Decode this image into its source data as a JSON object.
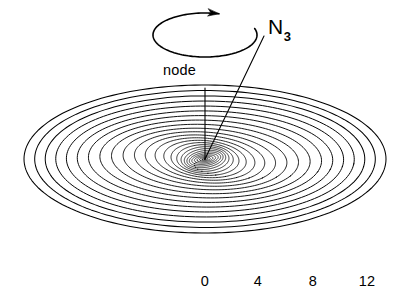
{
  "figure": {
    "type": "warped-disk-diagram",
    "background_color": "#ffffff",
    "line_color": "#000000"
  },
  "labels": {
    "node": "node",
    "angular_momentum_symbol": "N",
    "angular_momentum_subscript": "3"
  },
  "axis": {
    "ticks": [
      {
        "label": "0",
        "x": 205
      },
      {
        "label": "4",
        "x": 258
      },
      {
        "label": "8",
        "x": 313
      },
      {
        "label": "12",
        "x": 367
      }
    ],
    "tick_y": 274
  },
  "chart_data": {
    "type": "line",
    "title": "",
    "xlabel": "",
    "ylabel": "",
    "categories": [
      "0",
      "4",
      "8",
      "12"
    ],
    "values": [
      0,
      4,
      8,
      12
    ],
    "xlim": [
      0,
      13
    ],
    "grid": false,
    "legend": "none",
    "annotations": [
      "node",
      "N3"
    ],
    "geometry": {
      "center_x": 205,
      "center_y": 159,
      "outer_semi_major": 181,
      "outer_semi_minor": 74,
      "ring_count": 26,
      "spoke_count": 8,
      "twist_deg_total": 150,
      "tilt_scale_inner": 0.62
    },
    "rotation_arrow": {
      "center_x": 205,
      "center_y": 35,
      "rx": 52,
      "ry": 22,
      "direction": "clockwise-from-above"
    },
    "node_line": {
      "x1": 205,
      "y1": 88,
      "x2": 205,
      "y2": 159
    },
    "n3_vector": {
      "x1": 205,
      "y1": 159,
      "x2": 264,
      "y2": 36
    }
  }
}
